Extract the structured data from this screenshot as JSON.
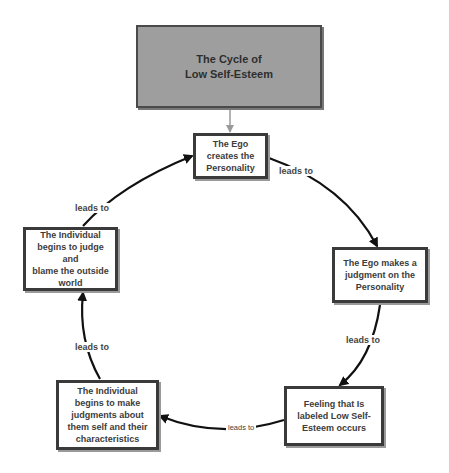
{
  "diagram": {
    "title": "The Cycle of\nLow Self-Esteem",
    "colors": {
      "title_fill": "#9e9e9e",
      "node_fill": "#ffffff",
      "border": "#3a3a3a",
      "edge": "#111111",
      "title_connector": "#9a9a9a",
      "text": "#3c3c3c"
    },
    "nodes": [
      {
        "id": "ego-creates",
        "text": "The Ego\ncreates the\nPersonality"
      },
      {
        "id": "ego-judgment",
        "text": "The Ego makes a\njudgment on the\nPersonality"
      },
      {
        "id": "feeling",
        "text": "Feeling that Is\nlabeled Low Self-\nEsteem occurs"
      },
      {
        "id": "self-judgments",
        "text": "The Individual\nbegins to make\njudgments about\nthem self and their\ncharacteristics"
      },
      {
        "id": "blame",
        "text": "The Individual\nbegins to judge and\nblame the outside\nworld"
      }
    ],
    "edges": [
      {
        "from": "ego-creates",
        "to": "ego-judgment",
        "label": "leads to"
      },
      {
        "from": "ego-judgment",
        "to": "feeling",
        "label": "leads to"
      },
      {
        "from": "feeling",
        "to": "self-judgments",
        "label": "leads to"
      },
      {
        "from": "self-judgments",
        "to": "blame",
        "label": "leads to"
      },
      {
        "from": "blame",
        "to": "ego-creates",
        "label": "leads to"
      }
    ]
  }
}
